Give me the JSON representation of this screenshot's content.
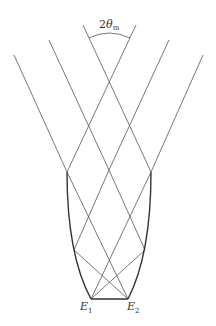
{
  "diagram": {
    "type": "compound-parabolic-concentrator ray diagram",
    "angle_label": {
      "prefix": "2",
      "symbol": "θ",
      "subscript": "m"
    },
    "edge_labels": [
      {
        "letter": "E",
        "subscript": "1"
      },
      {
        "letter": "E",
        "subscript": "2"
      }
    ],
    "colors": {
      "ray": "#555555",
      "wall": "#333333",
      "background": "#ffffff"
    },
    "incoming_rays_left": [
      {
        "from": [
          14,
          55
        ],
        "to": [
          67,
          172
        ]
      },
      {
        "from": [
          49,
          40
        ],
        "to": [
          109,
          170
        ]
      },
      {
        "from": [
          83,
          25
        ],
        "to": [
          151,
          172
        ]
      }
    ],
    "incoming_rays_right": [
      {
        "from": [
          203,
          55
        ],
        "to": [
          151,
          172
        ]
      },
      {
        "from": [
          169,
          40
        ],
        "to": [
          109,
          170
        ]
      },
      {
        "from": [
          136,
          25
        ],
        "to": [
          67,
          172
        ]
      }
    ],
    "inner_rays": [
      {
        "from": [
          67,
          172
        ],
        "to": [
          128,
          299
        ]
      },
      {
        "from": [
          151,
          172
        ],
        "to": [
          91,
          299
        ]
      },
      {
        "from": [
          109,
          170
        ],
        "to": [
          74,
          250
        ]
      },
      {
        "from": [
          109,
          170
        ],
        "to": [
          145,
          250
        ]
      },
      {
        "from": [
          74,
          250
        ],
        "to": [
          128,
          299
        ]
      },
      {
        "from": [
          145,
          250
        ],
        "to": [
          91,
          299
        ]
      }
    ],
    "walls": {
      "left": {
        "top": [
          67,
          172
        ],
        "bottom": [
          91,
          299
        ]
      },
      "right": {
        "top": [
          151,
          172
        ],
        "bottom": [
          128,
          299
        ]
      }
    },
    "exit_aperture": {
      "from": [
        91,
        299
      ],
      "to": [
        128,
        299
      ]
    }
  }
}
